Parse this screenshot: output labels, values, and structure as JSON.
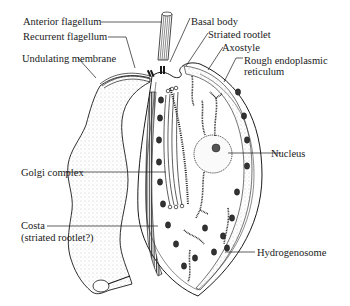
{
  "diagram": {
    "colors": {
      "ink": "#1a1a1a",
      "background": "#ffffff",
      "stipple": "#9a9a9a"
    },
    "labels": {
      "anterior_flagellum": "Anterior flagellum",
      "recurrent_flagellum": "Recurrent flagellum",
      "undulating_membrane": "Undulating membrane",
      "basal_body": "Basal body",
      "striated_rootlet": "Striated rootlet",
      "axostyle": "Axostyle",
      "rough_er_line1": "Rough endoplasmic",
      "rough_er_line2": "reticulum",
      "golgi_complex": "Golgi complex",
      "nucleus": "Nucleus",
      "costa_line1": "Costa",
      "costa_line2": "(striated rootlet?)",
      "hydrogenosome": "Hydrogenosome"
    }
  }
}
